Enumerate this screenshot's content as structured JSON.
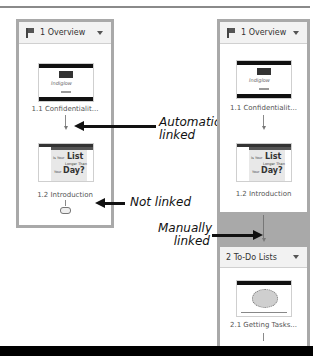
{
  "left_panel": {
    "section": {
      "number_title": "1 Overview",
      "icon": "flag-icon",
      "menu_icon": "chevron-down-icon"
    },
    "slides": [
      {
        "label": "1.1 Confidentialit...",
        "thumb_text": "Indiglow"
      },
      {
        "label": "1.2 Introduction",
        "thumb_text_1": "Is Your",
        "thumb_text_2": "List",
        "thumb_text_3": "Longer Than",
        "thumb_text_4": "Your",
        "thumb_text_5": "Day?"
      }
    ]
  },
  "right_panel": {
    "sections": [
      {
        "number_title": "1 Overview",
        "icon": "flag-icon",
        "menu_icon": "chevron-down-icon",
        "slides": [
          {
            "label": "1.1 Confidentialit...",
            "thumb_text": "Indiglow"
          },
          {
            "label": "1.2 Introduction",
            "thumb_text_1": "Is Your",
            "thumb_text_2": "List",
            "thumb_text_3": "Longer Than",
            "thumb_text_4": "Your",
            "thumb_text_5": "Day?"
          }
        ]
      },
      {
        "number_title": "2 To-Do Lists",
        "menu_icon": "chevron-down-icon",
        "slides": [
          {
            "label": "2.1 Getting Tasks..."
          }
        ]
      }
    ]
  },
  "callouts": {
    "auto_1": "Automatically",
    "auto_2": "linked",
    "not_linked": "Not linked",
    "manual_1": "Manually",
    "manual_2": "linked"
  }
}
